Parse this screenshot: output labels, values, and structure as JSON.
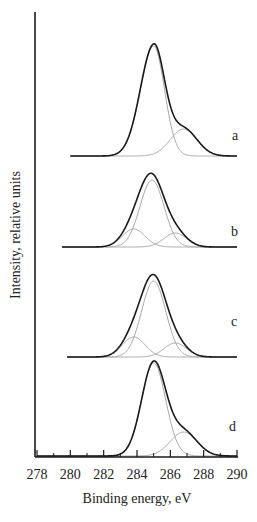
{
  "chart_data": {
    "type": "line",
    "title": "",
    "xlabel": "Binding energy, eV",
    "ylabel": "Intensity, relative units",
    "xlim": [
      278,
      290
    ],
    "x_ticks": [
      278,
      280,
      282,
      284,
      286,
      288,
      290
    ],
    "x_tick_labels": [
      "278",
      "280",
      "282",
      "284",
      "286",
      "288",
      "290"
    ],
    "x_minor_ticks": [
      279,
      281,
      283,
      285,
      287,
      289
    ],
    "y_ticks": [],
    "grid": false,
    "legend": null,
    "stacked_offset": true,
    "series": [
      {
        "name": "a",
        "label": "a",
        "x_start": 280,
        "envelope_peak_x": 285.1,
        "envelope_peak_height": 115,
        "components": [
          {
            "center": 285.0,
            "height": 110,
            "fwhm": 1.8,
            "tail": "right-sharp"
          },
          {
            "center": 286.8,
            "height": 27,
            "fwhm": 1.9
          }
        ]
      },
      {
        "name": "b",
        "label": "b",
        "x_start": 279.5,
        "envelope_peak_x": 284.9,
        "envelope_peak_height": 79,
        "components": [
          {
            "center": 283.8,
            "height": 18,
            "fwhm": 1.6
          },
          {
            "center": 284.9,
            "height": 67,
            "fwhm": 1.7
          },
          {
            "center": 286.3,
            "height": 14,
            "fwhm": 1.6
          }
        ]
      },
      {
        "name": "c",
        "label": "c",
        "x_start": 279.8,
        "envelope_peak_x": 285.0,
        "envelope_peak_height": 89,
        "components": [
          {
            "center": 283.8,
            "height": 20,
            "fwhm": 1.6
          },
          {
            "center": 285.0,
            "height": 76,
            "fwhm": 1.7
          },
          {
            "center": 286.3,
            "height": 14,
            "fwhm": 1.6
          }
        ]
      },
      {
        "name": "d",
        "label": "d",
        "x_start": 278,
        "envelope_peak_x": 285.1,
        "envelope_peak_height": 96,
        "components": [
          {
            "center": 285.0,
            "height": 93,
            "fwhm": 1.7
          },
          {
            "center": 286.8,
            "height": 24,
            "fwhm": 1.9
          }
        ]
      }
    ]
  },
  "layout": {
    "series_baselines_px": [
      156,
      247,
      357,
      456
    ],
    "label_positions_px": [
      [
        232,
        140
      ],
      [
        231,
        236
      ],
      [
        231,
        326
      ],
      [
        229,
        431
      ]
    ]
  },
  "colors": {
    "envelope": "#1a1a1a",
    "component": "#a8a8a8",
    "axis": "#1a1a1a"
  }
}
